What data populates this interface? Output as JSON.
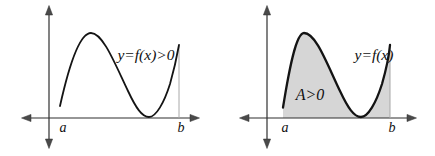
{
  "figure": {
    "left_plot": {
      "curve_label": "y=f(x)>0",
      "x_start_label": "a",
      "x_end_label": "b"
    },
    "right_plot": {
      "curve_label": "y=f(x)",
      "area_label": "A>0",
      "x_start_label": "a",
      "x_end_label": "b"
    }
  },
  "colors": {
    "shade": "#d6d6d6",
    "curve": "#141414",
    "axis": "#2f2f2f",
    "guide": "#a8a8a8",
    "background": "#ffffff"
  }
}
